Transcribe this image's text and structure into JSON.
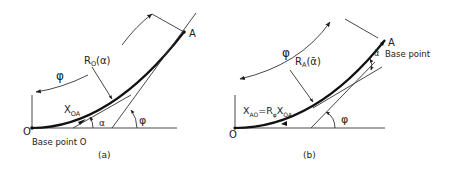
{
  "figure": {
    "panel_a": {
      "caption": "(a)",
      "origin_label": "O",
      "base_label": "Base point O",
      "end_label": "A",
      "arc_label": "R",
      "arc_label_sub": "O",
      "arc_label_arg": "(α)",
      "length_label": "X",
      "length_label_sub": "OA",
      "angle_alpha": "α",
      "angle_phi": "φ",
      "rotation_label": "φ"
    },
    "panel_b": {
      "caption": "(b)",
      "origin_label": "O",
      "end_label": "A",
      "base_label": "Base point",
      "arc_label": "R",
      "arc_label_sub": "A",
      "arc_label_arg": "(ᾱ)",
      "length_label": "X",
      "length_label_sub": "AO",
      "equals": "=R",
      "equals_sub": "φ",
      "length_label2": "X",
      "length_label2_sub": "OA",
      "angle_alpha": "ᾱ",
      "angle_phi": "φ",
      "rotation_label": "φ"
    }
  }
}
